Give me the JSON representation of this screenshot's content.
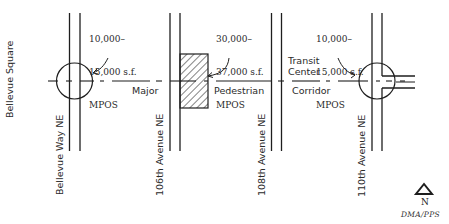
{
  "corridor": {
    "label_words": [
      "Major",
      "Pedestrian",
      "Corridor"
    ]
  },
  "side_label": "Bellevue Square",
  "streets": [
    {
      "name": "Bellevue Way NE"
    },
    {
      "name": "106th Avenue NE"
    },
    {
      "name": "108th Avenue NE"
    },
    {
      "name": "110th Avenue NE"
    }
  ],
  "callouts": [
    {
      "id": "mpos-bellevue-way",
      "lines": [
        "10,000–",
        "15,000 s.f.",
        "MPOS"
      ]
    },
    {
      "id": "mpos-106th",
      "lines": [
        "30,000–",
        "37,000 s.f.",
        "MPOS"
      ]
    },
    {
      "id": "mpos-110th",
      "lines": [
        "10,000–",
        "15,000 s.f.",
        "MPOS"
      ]
    }
  ],
  "transit_center": {
    "lines": [
      "Transit",
      "Center"
    ]
  },
  "north_arrow": {
    "label": "N"
  },
  "credit": "DMA/PPS",
  "colors": {
    "line": "#1e1e1e",
    "background": "#ffffff"
  }
}
